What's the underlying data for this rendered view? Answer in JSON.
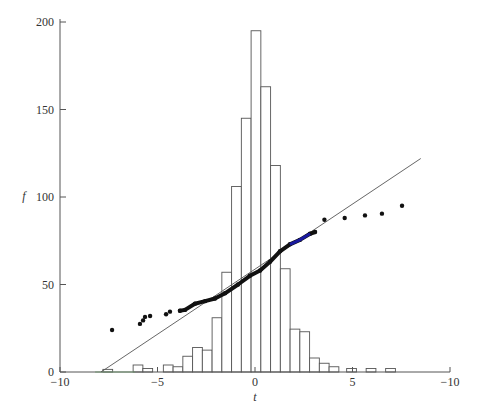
{
  "chart_data": {
    "type": "bar",
    "title": "",
    "xlabel": "t",
    "ylabel": "f",
    "xlim": [
      -10,
      10
    ],
    "ylim": [
      0,
      200
    ],
    "grid": false,
    "legend": null,
    "x_ticks": [
      {
        "value": -10,
        "label": "−10"
      },
      {
        "value": -5,
        "label": "−5"
      },
      {
        "value": 0,
        "label": "0"
      },
      {
        "value": 5,
        "label": "5"
      },
      {
        "value": 10,
        "label": "−10"
      }
    ],
    "y_ticks": [
      {
        "value": 0,
        "label": "0"
      },
      {
        "value": 50,
        "label": "50"
      },
      {
        "value": 100,
        "label": "100"
      },
      {
        "value": 150,
        "label": "150"
      },
      {
        "value": 200,
        "label": "200"
      }
    ],
    "series": [
      {
        "name": "histogram",
        "type": "bar",
        "bin_width": 0.5,
        "bins": [
          {
            "x0": -7.8,
            "h": 1.5
          },
          {
            "x0": -6.25,
            "h": 4
          },
          {
            "x0": -5.75,
            "h": 2
          },
          {
            "x0": -4.7,
            "h": 4
          },
          {
            "x0": -4.2,
            "h": 3
          },
          {
            "x0": -3.7,
            "h": 9
          },
          {
            "x0": -3.2,
            "h": 14
          },
          {
            "x0": -2.7,
            "h": 12.5
          },
          {
            "x0": -2.2,
            "h": 31
          },
          {
            "x0": -1.7,
            "h": 57
          },
          {
            "x0": -1.2,
            "h": 106
          },
          {
            "x0": -0.7,
            "h": 145
          },
          {
            "x0": -0.2,
            "h": 195
          },
          {
            "x0": 0.3,
            "h": 163
          },
          {
            "x0": 0.8,
            "h": 118
          },
          {
            "x0": 1.3,
            "h": 59
          },
          {
            "x0": 1.8,
            "h": 24.5
          },
          {
            "x0": 2.3,
            "h": 23
          },
          {
            "x0": 2.8,
            "h": 8
          },
          {
            "x0": 3.3,
            "h": 5
          },
          {
            "x0": 3.8,
            "h": 3
          },
          {
            "x0": 4.7,
            "h": 2
          },
          {
            "x0": 5.7,
            "h": 2
          },
          {
            "x0": 6.7,
            "h": 2
          }
        ]
      },
      {
        "name": "reference-line",
        "type": "line",
        "points": [
          [
            -7.9,
            0
          ],
          [
            8.5,
            122
          ]
        ]
      },
      {
        "name": "quantile-points",
        "type": "scatter",
        "points": [
          [
            -7.33,
            24
          ],
          [
            -5.9,
            27.5
          ],
          [
            -5.74,
            29.5
          ],
          [
            -5.64,
            31.5
          ],
          [
            -5.38,
            32
          ],
          [
            -4.56,
            33
          ],
          [
            -4.36,
            34.5
          ],
          [
            -3.85,
            35
          ],
          [
            -3.59,
            35.5
          ],
          [
            -3.08,
            39
          ],
          [
            -2.56,
            40.5
          ],
          [
            -2.05,
            42
          ],
          [
            -1.54,
            45
          ],
          [
            -0.87,
            50
          ],
          [
            -0.26,
            55
          ],
          [
            0.26,
            58
          ],
          [
            0.77,
            63
          ],
          [
            1.28,
            69
          ],
          [
            1.79,
            73
          ],
          [
            2.3,
            75.5
          ],
          [
            2.82,
            79
          ],
          [
            3.08,
            80
          ],
          [
            3.56,
            87
          ],
          [
            4.6,
            88
          ],
          [
            5.64,
            89.5
          ],
          [
            6.51,
            90.5
          ],
          [
            7.54,
            95
          ]
        ],
        "color": "#111111",
        "highlight_segment": {
          "x": [
            1.9,
            2.55
          ],
          "color": "#1a1aa0"
        }
      },
      {
        "name": "baseline-highlight",
        "type": "segment",
        "points": [
          [
            -8.2,
            0
          ],
          [
            -6.15,
            0
          ]
        ],
        "color": "#8fd68f"
      }
    ]
  },
  "colors": {
    "axis": "#555555",
    "bar_stroke": "#555555",
    "line": "#555555",
    "points": "#111111",
    "blue": "#1a1aa0",
    "green": "#8fd68f"
  }
}
